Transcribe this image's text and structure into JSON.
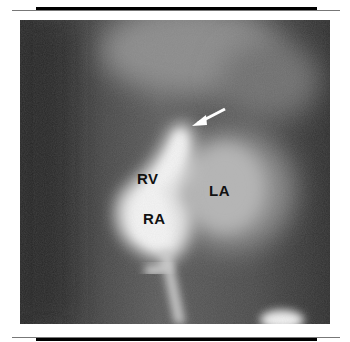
{
  "figure": {
    "type": "angiogram",
    "labels": {
      "rv": "RV",
      "ra": "RA",
      "la": "LA"
    },
    "annotations": [
      "arrow-pointing-to-structure"
    ]
  }
}
